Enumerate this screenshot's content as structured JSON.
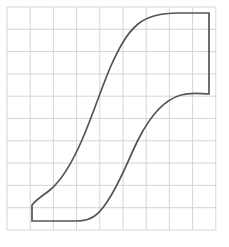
{
  "canvas": {
    "width": 229,
    "height": 247,
    "background_color": "#ffffff"
  },
  "grid": {
    "name": "graph-paper-grid",
    "left": 7,
    "top": 7,
    "right": 216,
    "bottom": 230,
    "columns": 9,
    "rows": 10,
    "cell_width": 23.2,
    "cell_height": 22.3,
    "line_color": "#d0d0d2",
    "line_width": 0.9,
    "border_color": "#d0d0d2"
  },
  "figure": {
    "name": "ogee-s-curve-profile",
    "stroke_color": "#555558",
    "stroke_width": 1.7,
    "fill": "none",
    "path": "M 32 221 L 77 221 C 92 221 99 214 107 202 C 121 181 128 160 138 140 C 149 118 163 100 181 95 C 192 92 201 94 209 94 L 209 13 L 178 13 C 160 13 148 16 138 24 C 126 34 118 50 110 68 C 100 92 92 117 82 140 C 72 163 62 180 50 190 C 44 195 38 198 32 205 Z",
    "anchor_points": [
      {
        "name": "foot-bottom-left",
        "x": 32,
        "y": 221
      },
      {
        "name": "foot-bottom-right",
        "x": 77,
        "y": 221
      },
      {
        "name": "lower-shelf-right",
        "x": 209,
        "y": 94
      },
      {
        "name": "head-top-right",
        "x": 209,
        "y": 13
      },
      {
        "name": "head-top-left",
        "x": 178,
        "y": 13
      },
      {
        "name": "foot-upper-left",
        "x": 32,
        "y": 205
      }
    ]
  }
}
